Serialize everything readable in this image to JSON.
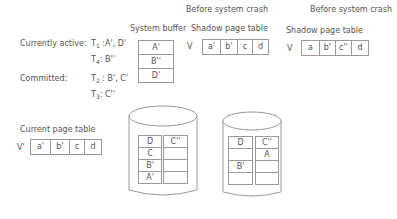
{
  "headings": {
    "before_crash_1": "Before system crash",
    "before_crash_2": "Before system crash"
  },
  "transactions": {
    "active_label": "Currently active:",
    "committed_label": "Committed:",
    "t1": {
      "name": "T",
      "sub": "1",
      "pages": ":A', D'"
    },
    "t4": {
      "name": "T",
      "sub": "4",
      "pages": ": B''"
    },
    "t2": {
      "name": "T",
      "sub": "2",
      "pages": ": B', C'"
    },
    "t3": {
      "name": "T",
      "sub": "3",
      "pages": ": C''"
    }
  },
  "system_buffer": {
    "title": "System buffer",
    "cells": [
      "A'",
      "B''",
      "D'"
    ]
  },
  "shadow_table_1": {
    "title": "Shadow page table",
    "prefix": "V",
    "cells": [
      "a'",
      "b'",
      "c",
      "d"
    ]
  },
  "shadow_table_2": {
    "title": "Shadow page table",
    "prefix": "V",
    "cells": [
      "a",
      "b'",
      "c''",
      "d"
    ]
  },
  "current_table": {
    "title": "Current page table",
    "prefix": "V'",
    "cells": [
      "a'",
      "b'",
      "c",
      "d"
    ]
  },
  "disk_1": {
    "left_column": [
      "D",
      "C",
      "B'",
      "A'"
    ],
    "right_column": [
      "C''",
      "",
      "",
      ""
    ]
  },
  "disk_2": {
    "left_column": [
      "D",
      "",
      "B'",
      ""
    ],
    "right_column": [
      "C''",
      "A",
      "",
      ""
    ]
  }
}
